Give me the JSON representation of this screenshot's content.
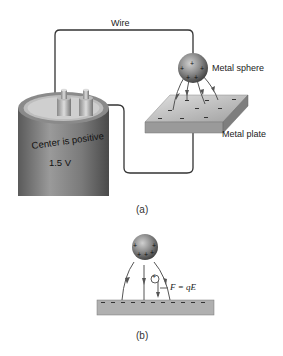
{
  "figure_a": {
    "caption": "(a)",
    "labels": {
      "wire": "Wire",
      "sphere": "Metal sphere",
      "plate": "Metal plate"
    },
    "battery": {
      "line1": "Center is positive",
      "line2": "1.5 V"
    }
  },
  "figure_b": {
    "caption": "(b)",
    "force_equation": "F = qE",
    "test_charge": "+"
  },
  "colors": {
    "wire": "#333333",
    "battery_body": "#6e6e6e",
    "sphere": "#7a7a7a",
    "plate": "#b8b8b8",
    "field_line": "#555555"
  }
}
